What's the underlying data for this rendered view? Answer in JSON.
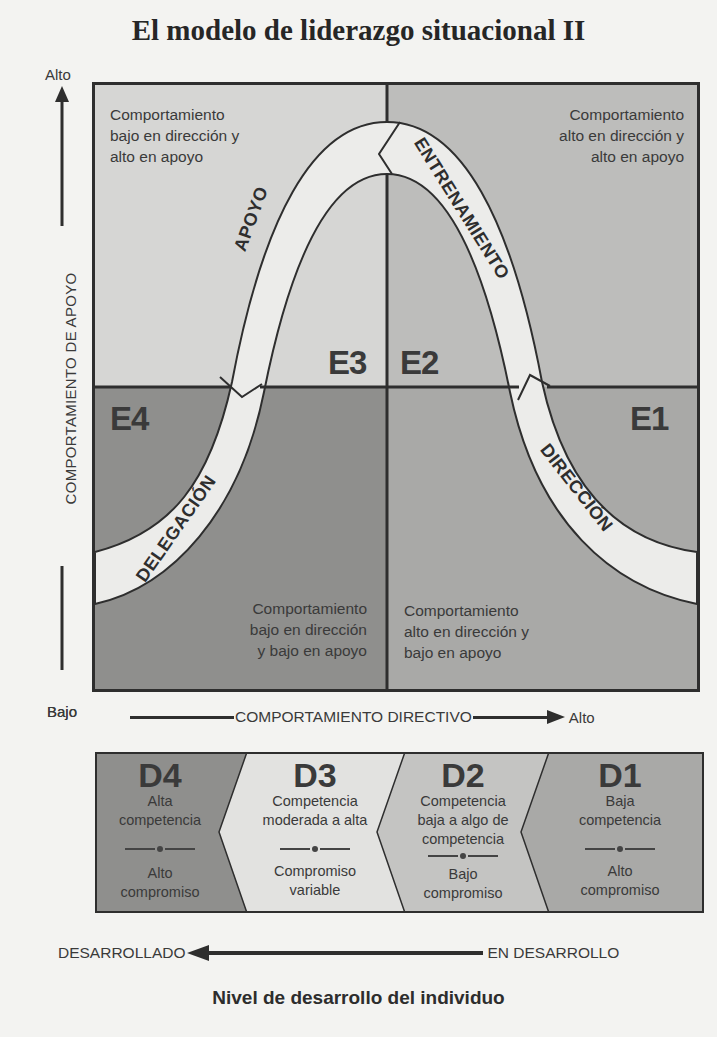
{
  "title": "El modelo de liderazgo situacional II",
  "y_axis": {
    "label": "COMPORTAMIENTO DE APOYO",
    "high": "Alto",
    "low": "Bajo"
  },
  "x_axis": {
    "label": "COMPORTAMIENTO DIRECTIVO",
    "low": "Bajo",
    "high": "Alto"
  },
  "quadrants": [
    {
      "id": "E3",
      "label": "E3",
      "style": "APOYO",
      "description": [
        "Comportamiento",
        "bajo en dirección y",
        "alto en apoyo"
      ],
      "color": "#d6d6d4"
    },
    {
      "id": "E2",
      "label": "E2",
      "style": "ENTRENAMIENTO",
      "description": [
        "Comportamiento",
        "alto en dirección y",
        "alto en apoyo"
      ],
      "color": "#bdbdbb"
    },
    {
      "id": "E4",
      "label": "E4",
      "style": "DELEGACIÓN",
      "description": [
        "Comportamiento",
        "bajo en dirección",
        "y bajo en apoyo"
      ],
      "color": "#8f8f8d"
    },
    {
      "id": "E1",
      "label": "E1",
      "style": "DIRECCIÓN",
      "description": [
        "Comportamiento",
        "alto en dirección y",
        "bajo en apoyo"
      ],
      "color": "#a9a9a7"
    }
  ],
  "curve_labels": {
    "apoyo": "APOYO",
    "entrenamiento": "ENTRENAMIENTO",
    "delegacion": "DELEGACIÓN",
    "direccion": "DIRECCIÓN"
  },
  "development_levels": [
    {
      "id": "D4",
      "label": "D4",
      "competence": [
        "Alta",
        "competencia"
      ],
      "commitment": [
        "Alto",
        "compromiso"
      ],
      "color": "#8f8f8d"
    },
    {
      "id": "D3",
      "label": "D3",
      "competence": [
        "Competencia",
        "moderada a alta"
      ],
      "commitment": [
        "Compromiso",
        "variable"
      ],
      "color": "#e2e2e0"
    },
    {
      "id": "D2",
      "label": "D2",
      "competence": [
        "Competencia",
        "baja a algo de",
        "competencia"
      ],
      "commitment": [
        "Bajo",
        "compromiso"
      ],
      "color": "#c4c4c2"
    },
    {
      "id": "D1",
      "label": "D1",
      "competence": [
        "Baja",
        "competencia"
      ],
      "commitment": [
        "Alto",
        "compromiso"
      ],
      "color": "#a9a9a7"
    }
  ],
  "development_axis": {
    "left": "DESARROLLADO",
    "right": "EN DESARROLLO",
    "title": "Nivel de desarrollo del individuo"
  },
  "colors": {
    "curve_fill": "#ececea",
    "border": "#2e2e2e",
    "text": "#3a3a3a"
  }
}
